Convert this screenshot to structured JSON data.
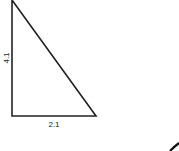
{
  "diagram": {
    "shape": "right-triangle",
    "vertical_side_label": "4.1",
    "horizontal_side_label": "2.1",
    "stroke_color": "#222222",
    "background": "#ffffff"
  }
}
